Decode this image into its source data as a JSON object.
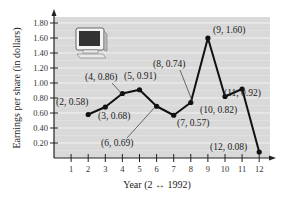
{
  "chart_data": {
    "type": "line",
    "title": "",
    "xlabel": "Year (2 ↔ 1992)",
    "ylabel": "Earnings per share (in dollars)",
    "x": [
      2,
      3,
      4,
      5,
      6,
      7,
      8,
      9,
      10,
      11,
      12
    ],
    "series": [
      {
        "name": "Earnings per share",
        "values": [
          0.58,
          0.68,
          0.86,
          0.91,
          0.69,
          0.57,
          0.74,
          1.6,
          0.82,
          0.92,
          0.08
        ]
      }
    ],
    "point_labels": [
      "(2, 0.58)",
      "(3, 0.68)",
      "(4, 0.86)",
      "(5, 0.91)",
      "(6, 0.69)",
      "(7, 0.57)",
      "(8, 0.74)",
      "(9, 1.60)",
      "(10, 0.82)",
      "(11, 0.92)",
      "(12, 0.08)"
    ],
    "xticks": [
      "1",
      "2",
      "3",
      "4",
      "5",
      "6",
      "7",
      "8",
      "9",
      "10",
      "11",
      "12"
    ],
    "yticks": [
      "0.20",
      "0.40",
      "0.60",
      "0.80",
      "1.00",
      "1.20",
      "1.40",
      "1.60",
      "1.80"
    ],
    "xlim": [
      0,
      12.5
    ],
    "ylim": [
      0,
      1.9
    ],
    "grid": true,
    "legend": null,
    "decoration": "computer-monitor-icon"
  },
  "colors": {
    "plot_background": "#d9d9d9",
    "gridline": "#f2f2f2",
    "line": "#111111",
    "axis": "#222222"
  }
}
